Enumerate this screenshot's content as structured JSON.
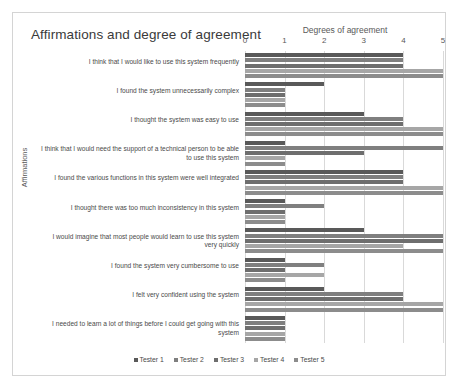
{
  "chart_data": {
    "type": "bar",
    "orientation": "horizontal",
    "title": "Affirmations and degree of agreement",
    "xlabel": "Degrees of agreement",
    "ylabel": "Affirmations",
    "xlim": [
      0,
      5
    ],
    "xticks": [
      "0",
      "1",
      "2",
      "3",
      "4",
      "5"
    ],
    "grid": true,
    "legend_position": "bottom",
    "categories": [
      "I think that I would like to use this system frequently",
      "I found the system unnecessarily complex",
      "I thought the system was easy to use",
      "I think that I would need the support of a technical person to be able to use this system",
      "I found the various functions in this system were well integrated",
      "I thought there was too much inconsistency in this system",
      "I would imagine that most people would learn to use this system very quickly",
      "I found the system very cumbersome to use",
      "I felt very confident using the system",
      "I needed to learn a lot of things before I could get going with this system"
    ],
    "series": [
      {
        "name": "Tester 1",
        "color": "#595959",
        "values": [
          4,
          2,
          3,
          1,
          4,
          1,
          3,
          1,
          2,
          1
        ]
      },
      {
        "name": "Tester 2",
        "color": "#7f7f7f",
        "values": [
          4,
          1,
          4,
          5,
          4,
          2,
          5,
          2,
          4,
          1
        ]
      },
      {
        "name": "Tester 3",
        "color": "#6e6e6e",
        "values": [
          4,
          1,
          4,
          3,
          4,
          1,
          5,
          1,
          4,
          1
        ]
      },
      {
        "name": "Tester 4",
        "color": "#a6a6a6",
        "values": [
          5,
          1,
          5,
          1,
          5,
          1,
          4,
          2,
          5,
          1
        ]
      },
      {
        "name": "Tester 5",
        "color": "#8c8c8c",
        "values": [
          5,
          1,
          5,
          1,
          5,
          1,
          5,
          1,
          5,
          1
        ]
      }
    ]
  }
}
